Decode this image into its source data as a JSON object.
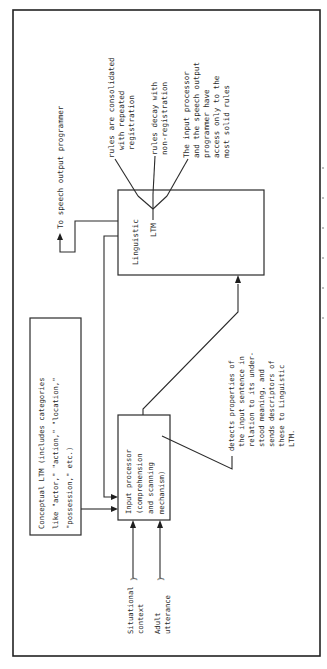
{
  "diagram": {
    "orientation": "rotated-90-counterclockwise",
    "linguistic_ltm": {
      "title": "Linguistic",
      "subtitle": "LTM"
    },
    "linguistic_notes": [
      {
        "id": "consolidation",
        "lines": [
          "rules are consolidated",
          "with repeated",
          "registration"
        ]
      },
      {
        "id": "decay",
        "lines": [
          "rules decay with",
          "non-registration"
        ]
      },
      {
        "id": "access",
        "lines": [
          "The input processor",
          "and the speech output",
          "programmer have",
          "access only to the",
          "most solid rules"
        ]
      }
    ],
    "speech_output": {
      "label": "To speech output programmer"
    },
    "conceptual_ltm": {
      "lines": [
        "Conceptual LTM (includes categories",
        "like \"actor,\" \"action,\" \"location,\"",
        "\"possession,\" etc.)"
      ]
    },
    "input_processor": {
      "lines": [
        "Input processor",
        "(comprehension",
        "and scanning",
        "mechanism)"
      ]
    },
    "input_processor_note": {
      "lines": [
        "detects properties of",
        "the input sentence in",
        "relation to its under-",
        "stood meaning, and",
        "sends descriptors of",
        "these to Linguistic",
        "LTM."
      ]
    },
    "inputs": [
      {
        "id": "situational-context",
        "lines": [
          "Situational",
          "context"
        ]
      },
      {
        "id": "adult-utterance",
        "lines": [
          "Adult",
          "utterance"
        ]
      }
    ]
  }
}
